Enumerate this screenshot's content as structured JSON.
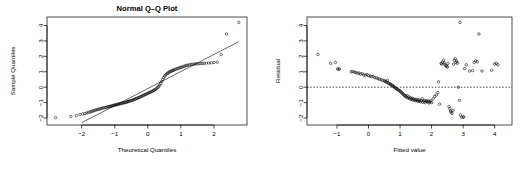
{
  "figure": {
    "width": 530,
    "height": 172,
    "background": "#ffffff",
    "foreground": "#000000",
    "panels": 2
  },
  "chart_data": [
    {
      "type": "scatter",
      "name": "normal-qq-plot",
      "title": "Normal Q–Q Plot",
      "xlabel": "Theoretical Quantiles",
      "ylabel": "Sample Quantiles",
      "xlim": [
        -3.05,
        3.0
      ],
      "ylim": [
        -2.45,
        4.55
      ],
      "xticks": [
        -2,
        -1,
        0,
        1,
        2
      ],
      "yticks": [
        -2,
        -1,
        0,
        1,
        2,
        3,
        4
      ],
      "grid": false,
      "legend": null,
      "marker": "open-circle",
      "reference_line": {
        "type": "qqline",
        "description": "straight line through first and third quartiles",
        "x": [
          -2.0,
          2.75
        ],
        "y": [
          -2.3,
          2.95
        ]
      },
      "points": [
        [
          -2.79,
          -1.97
        ],
        [
          -2.33,
          -1.9
        ],
        [
          -2.16,
          -1.84
        ],
        [
          -2.05,
          -1.78
        ],
        [
          -1.97,
          -1.73
        ],
        [
          -1.9,
          -1.7
        ],
        [
          -1.84,
          -1.67
        ],
        [
          -1.79,
          -1.63
        ],
        [
          -1.74,
          -1.6
        ],
        [
          -1.7,
          -1.57
        ],
        [
          -1.66,
          -1.54
        ],
        [
          -1.62,
          -1.51
        ],
        [
          -1.58,
          -1.48
        ],
        [
          -1.54,
          -1.46
        ],
        [
          -1.5,
          -1.44
        ],
        [
          -1.46,
          -1.41
        ],
        [
          -1.42,
          -1.39
        ],
        [
          -1.38,
          -1.36
        ],
        [
          -1.34,
          -1.34
        ],
        [
          -1.3,
          -1.32
        ],
        [
          -1.26,
          -1.3
        ],
        [
          -1.22,
          -1.28
        ],
        [
          -1.19,
          -1.26
        ],
        [
          -1.16,
          -1.25
        ],
        [
          -1.13,
          -1.24
        ],
        [
          -1.1,
          -1.22
        ],
        [
          -1.07,
          -1.2
        ],
        [
          -1.04,
          -1.18
        ],
        [
          -1.01,
          -1.16
        ],
        [
          -0.98,
          -1.15
        ],
        [
          -0.95,
          -1.13
        ],
        [
          -0.92,
          -1.12
        ],
        [
          -0.89,
          -1.1
        ],
        [
          -0.86,
          -1.08
        ],
        [
          -0.83,
          -1.07
        ],
        [
          -0.8,
          -1.05
        ],
        [
          -0.77,
          -1.03
        ],
        [
          -0.74,
          -1.02
        ],
        [
          -0.71,
          -1.0
        ],
        [
          -0.68,
          -0.99
        ],
        [
          -0.65,
          -0.97
        ],
        [
          -0.62,
          -0.95
        ],
        [
          -0.6,
          -0.93
        ],
        [
          -0.57,
          -0.91
        ],
        [
          -0.54,
          -0.89
        ],
        [
          -0.51,
          -0.87
        ],
        [
          -0.48,
          -0.85
        ],
        [
          -0.45,
          -0.83
        ],
        [
          -0.42,
          -0.8
        ],
        [
          -0.39,
          -0.78
        ],
        [
          -0.36,
          -0.75
        ],
        [
          -0.33,
          -0.72
        ],
        [
          -0.3,
          -0.7
        ],
        [
          -0.27,
          -0.67
        ],
        [
          -0.24,
          -0.64
        ],
        [
          -0.21,
          -0.61
        ],
        [
          -0.18,
          -0.58
        ],
        [
          -0.15,
          -0.55
        ],
        [
          -0.12,
          -0.52
        ],
        [
          -0.09,
          -0.49
        ],
        [
          -0.06,
          -0.46
        ],
        [
          -0.03,
          -0.43
        ],
        [
          0.0,
          -0.4
        ],
        [
          0.03,
          -0.37
        ],
        [
          0.06,
          -0.34
        ],
        [
          0.09,
          -0.31
        ],
        [
          0.12,
          -0.28
        ],
        [
          0.15,
          -0.25
        ],
        [
          0.18,
          -0.21
        ],
        [
          0.21,
          -0.17
        ],
        [
          0.24,
          -0.13
        ],
        [
          0.27,
          -0.08
        ],
        [
          0.3,
          -0.02
        ],
        [
          0.33,
          0.05
        ],
        [
          0.36,
          0.14
        ],
        [
          0.39,
          0.25
        ],
        [
          0.42,
          0.37
        ],
        [
          0.45,
          0.5
        ],
        [
          0.48,
          0.62
        ],
        [
          0.51,
          0.72
        ],
        [
          0.54,
          0.8
        ],
        [
          0.57,
          0.86
        ],
        [
          0.6,
          0.91
        ],
        [
          0.63,
          0.95
        ],
        [
          0.66,
          0.99
        ],
        [
          0.69,
          1.02
        ],
        [
          0.72,
          1.05
        ],
        [
          0.75,
          1.08
        ],
        [
          0.78,
          1.11
        ],
        [
          0.81,
          1.14
        ],
        [
          0.85,
          1.17
        ],
        [
          0.89,
          1.2
        ],
        [
          0.93,
          1.23
        ],
        [
          0.97,
          1.26
        ],
        [
          1.01,
          1.29
        ],
        [
          1.05,
          1.32
        ],
        [
          1.09,
          1.35
        ],
        [
          1.13,
          1.38
        ],
        [
          1.17,
          1.41
        ],
        [
          1.21,
          1.43
        ],
        [
          1.26,
          1.45
        ],
        [
          1.31,
          1.47
        ],
        [
          1.36,
          1.49
        ],
        [
          1.41,
          1.5
        ],
        [
          1.46,
          1.51
        ],
        [
          1.52,
          1.52
        ],
        [
          1.58,
          1.53
        ],
        [
          1.64,
          1.54
        ],
        [
          1.7,
          1.55
        ],
        [
          1.77,
          1.56
        ],
        [
          1.84,
          1.57
        ],
        [
          1.92,
          1.58
        ],
        [
          2.0,
          1.6
        ],
        [
          2.1,
          1.62
        ],
        [
          2.22,
          2.12
        ],
        [
          2.38,
          3.45
        ],
        [
          2.75,
          4.2
        ]
      ],
      "point_count": 119
    },
    {
      "type": "scatter",
      "name": "residual-vs-fitted-plot",
      "title": "",
      "xlabel": "Fitted value",
      "ylabel": "Residual",
      "xlim": [
        -1.95,
        4.55
      ],
      "ylim": [
        -2.45,
        4.55
      ],
      "xticks": [
        -1,
        0,
        1,
        2,
        3,
        4
      ],
      "yticks": [
        -2,
        -1,
        0,
        1,
        2,
        3,
        4
      ],
      "grid": false,
      "legend": null,
      "marker": "open-circle",
      "reference_line": {
        "type": "horizontal-dashed",
        "description": "dashed reference line at residual = 0",
        "y": 0
      },
      "points": [
        [
          -1.6,
          2.12
        ],
        [
          -1.2,
          1.55
        ],
        [
          -1.05,
          1.6
        ],
        [
          -0.98,
          1.2
        ],
        [
          -0.95,
          1.15
        ],
        [
          -0.92,
          1.18
        ],
        [
          -0.55,
          1.0
        ],
        [
          -0.5,
          1.02
        ],
        [
          -0.45,
          0.98
        ],
        [
          -0.4,
          0.95
        ],
        [
          -0.35,
          0.9
        ],
        [
          -0.3,
          0.92
        ],
        [
          -0.25,
          0.85
        ],
        [
          -0.2,
          0.88
        ],
        [
          -0.15,
          0.8
        ],
        [
          -0.1,
          0.78
        ],
        [
          -0.05,
          0.82
        ],
        [
          0.0,
          0.75
        ],
        [
          0.05,
          0.72
        ],
        [
          0.1,
          0.68
        ],
        [
          0.15,
          0.7
        ],
        [
          0.2,
          0.62
        ],
        [
          0.25,
          0.6
        ],
        [
          0.3,
          0.55
        ],
        [
          0.35,
          0.52
        ],
        [
          0.4,
          0.48
        ],
        [
          0.45,
          0.45
        ],
        [
          0.5,
          0.42
        ],
        [
          0.52,
          0.38
        ],
        [
          0.55,
          0.35
        ],
        [
          0.58,
          0.32
        ],
        [
          0.6,
          0.45
        ],
        [
          0.62,
          0.28
        ],
        [
          0.65,
          0.25
        ],
        [
          0.68,
          0.22
        ],
        [
          0.7,
          0.18
        ],
        [
          0.72,
          0.15
        ],
        [
          0.75,
          0.12
        ],
        [
          0.78,
          0.08
        ],
        [
          0.8,
          0.05
        ],
        [
          0.82,
          0.0
        ],
        [
          0.85,
          -0.05
        ],
        [
          0.88,
          -0.08
        ],
        [
          0.9,
          -0.12
        ],
        [
          0.92,
          -0.15
        ],
        [
          0.95,
          -0.18
        ],
        [
          0.98,
          -0.22
        ],
        [
          1.0,
          -0.25
        ],
        [
          1.02,
          -0.3
        ],
        [
          1.05,
          -0.35
        ],
        [
          1.08,
          -0.4
        ],
        [
          1.1,
          -0.45
        ],
        [
          1.12,
          -0.5
        ],
        [
          1.15,
          -0.55
        ],
        [
          1.18,
          -0.6
        ],
        [
          1.2,
          -0.65
        ],
        [
          1.22,
          -0.55
        ],
        [
          1.25,
          -0.7
        ],
        [
          1.28,
          -0.62
        ],
        [
          1.3,
          -0.75
        ],
        [
          1.32,
          -0.68
        ],
        [
          1.35,
          -0.78
        ],
        [
          1.38,
          -0.72
        ],
        [
          1.4,
          -0.82
        ],
        [
          1.42,
          -0.75
        ],
        [
          1.45,
          -0.85
        ],
        [
          1.48,
          -0.78
        ],
        [
          1.5,
          -0.88
        ],
        [
          1.52,
          -0.8
        ],
        [
          1.55,
          -0.9
        ],
        [
          1.58,
          -0.82
        ],
        [
          1.6,
          -0.92
        ],
        [
          1.62,
          -0.85
        ],
        [
          1.65,
          -0.95
        ],
        [
          1.68,
          -0.88
        ],
        [
          1.7,
          -0.75
        ],
        [
          1.72,
          -0.98
        ],
        [
          1.75,
          -0.9
        ],
        [
          1.78,
          -0.85
        ],
        [
          1.8,
          -1.0
        ],
        [
          1.82,
          -0.92
        ],
        [
          1.85,
          -0.88
        ],
        [
          1.88,
          -0.95
        ],
        [
          1.9,
          -0.9
        ],
        [
          1.92,
          -1.02
        ],
        [
          1.95,
          -0.95
        ],
        [
          1.98,
          -0.88
        ],
        [
          2.0,
          -1.0
        ],
        [
          2.05,
          -0.75
        ],
        [
          2.1,
          -0.6
        ],
        [
          2.15,
          -0.5
        ],
        [
          2.2,
          -0.35
        ],
        [
          2.22,
          0.35
        ],
        [
          2.25,
          -1.1
        ],
        [
          2.3,
          1.55
        ],
        [
          2.32,
          1.5
        ],
        [
          2.35,
          1.62
        ],
        [
          2.38,
          1.75
        ],
        [
          2.4,
          1.58
        ],
        [
          2.42,
          1.45
        ],
        [
          2.45,
          1.4
        ],
        [
          2.48,
          1.35
        ],
        [
          2.5,
          1.3
        ],
        [
          2.52,
          1.55
        ],
        [
          2.55,
          -1.25
        ],
        [
          2.58,
          -1.4
        ],
        [
          2.6,
          -1.55
        ],
        [
          2.62,
          -1.62
        ],
        [
          2.65,
          -1.7
        ],
        [
          2.68,
          -1.5
        ],
        [
          2.7,
          1.5
        ],
        [
          2.72,
          1.75
        ],
        [
          2.75,
          1.85
        ],
        [
          2.78,
          1.6
        ],
        [
          2.8,
          1.7
        ],
        [
          2.82,
          1.55
        ],
        [
          2.85,
          0.0
        ],
        [
          2.88,
          -0.85
        ],
        [
          2.9,
          4.2
        ],
        [
          2.92,
          -1.8
        ],
        [
          2.95,
          -1.95
        ],
        [
          3.0,
          -1.95
        ],
        [
          3.02,
          -1.92
        ],
        [
          3.05,
          1.2
        ],
        [
          3.1,
          1.45
        ],
        [
          3.2,
          1.05
        ],
        [
          3.3,
          1.08
        ],
        [
          3.35,
          1.6
        ],
        [
          3.4,
          1.7
        ],
        [
          3.45,
          1.65
        ],
        [
          3.5,
          3.45
        ],
        [
          3.6,
          1.05
        ],
        [
          3.9,
          1.1
        ],
        [
          4.0,
          1.5
        ],
        [
          4.05,
          1.55
        ],
        [
          4.1,
          1.45
        ]
      ],
      "point_count": 136
    }
  ]
}
